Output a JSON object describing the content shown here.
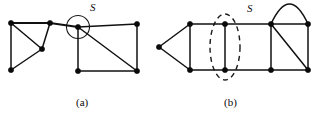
{
  "figure": {
    "panels": [
      {
        "id": "panel-a",
        "caption": "(a)",
        "caption_x": 76,
        "caption_y": 106,
        "cut_label": "S",
        "cut_label_x": 90,
        "cut_label_y": 11,
        "cut_type": "vertex-cut-circle",
        "cut_circle": {
          "cx": 78,
          "cy": 27,
          "r": 11.5
        },
        "vertices": [
          {
            "name": "a-v1",
            "x": 11,
            "y": 23
          },
          {
            "name": "a-v2",
            "x": 11,
            "y": 70
          },
          {
            "name": "a-v3",
            "x": 42,
            "y": 49
          },
          {
            "name": "a-v4",
            "x": 50,
            "y": 23
          },
          {
            "name": "a-v5",
            "x": 78,
            "y": 27
          },
          {
            "name": "a-v6",
            "x": 78,
            "y": 71
          },
          {
            "name": "a-v7",
            "x": 137,
            "y": 24
          },
          {
            "name": "a-v8",
            "x": 137,
            "y": 71
          }
        ],
        "edges": [
          {
            "name": "a-e1",
            "from": 0,
            "to": 1,
            "style": "thin"
          },
          {
            "name": "a-e2",
            "from": 0,
            "to": 2,
            "style": "thin"
          },
          {
            "name": "a-e3",
            "from": 1,
            "to": 2,
            "style": "thin"
          },
          {
            "name": "a-e4",
            "from": 2,
            "to": 3,
            "style": "thin"
          },
          {
            "name": "a-e5",
            "from": 0,
            "to": 3,
            "style": "thick"
          },
          {
            "name": "a-e6",
            "from": 3,
            "to": 4,
            "style": "thick"
          },
          {
            "name": "a-e7",
            "from": 4,
            "to": 6,
            "style": "thin"
          },
          {
            "name": "a-e8",
            "from": 4,
            "to": 5,
            "style": "thin"
          },
          {
            "name": "a-e9",
            "from": 4,
            "to": 7,
            "style": "thin"
          },
          {
            "name": "a-e10",
            "from": 5,
            "to": 7,
            "style": "thin"
          },
          {
            "name": "a-e11",
            "from": 6,
            "to": 7,
            "style": "thin"
          }
        ],
        "arcs": []
      },
      {
        "id": "panel-b",
        "caption": "(b)",
        "caption_x": 224,
        "caption_y": 106,
        "cut_label": "S",
        "cut_label_x": 247,
        "cut_label_y": 12,
        "cut_type": "edge-cut-dashed-ellipse",
        "cut_ellipse": {
          "cx": 225,
          "cy": 47,
          "rx": 15,
          "ry": 33
        },
        "vertices": [
          {
            "name": "b-v1",
            "x": 159,
            "y": 47
          },
          {
            "name": "b-v2",
            "x": 190,
            "y": 24
          },
          {
            "name": "b-v3",
            "x": 190,
            "y": 70
          },
          {
            "name": "b-v4",
            "x": 225,
            "y": 24
          },
          {
            "name": "b-v5",
            "x": 225,
            "y": 70
          },
          {
            "name": "b-v6",
            "x": 271,
            "y": 24
          },
          {
            "name": "b-v7",
            "x": 271,
            "y": 70
          },
          {
            "name": "b-v8",
            "x": 308,
            "y": 24
          },
          {
            "name": "b-v9",
            "x": 308,
            "y": 70
          }
        ],
        "edges": [
          {
            "name": "b-e1",
            "from": 0,
            "to": 1,
            "style": "thin"
          },
          {
            "name": "b-e2",
            "from": 0,
            "to": 2,
            "style": "thin"
          },
          {
            "name": "b-e3",
            "from": 1,
            "to": 2,
            "style": "thin"
          },
          {
            "name": "b-e4",
            "from": 1,
            "to": 3,
            "style": "thin"
          },
          {
            "name": "b-e5",
            "from": 2,
            "to": 4,
            "style": "thin"
          },
          {
            "name": "b-e6",
            "from": 3,
            "to": 4,
            "style": "thin"
          },
          {
            "name": "b-e7",
            "from": 3,
            "to": 5,
            "style": "thin"
          },
          {
            "name": "b-e8",
            "from": 4,
            "to": 6,
            "style": "thin"
          },
          {
            "name": "b-e9",
            "from": 5,
            "to": 6,
            "style": "thin"
          },
          {
            "name": "b-e10",
            "from": 5,
            "to": 7,
            "style": "thin"
          },
          {
            "name": "b-e11",
            "from": 6,
            "to": 8,
            "style": "thin"
          },
          {
            "name": "b-e12",
            "from": 7,
            "to": 8,
            "style": "thin"
          },
          {
            "name": "b-e13",
            "from": 5,
            "to": 8,
            "style": "thin"
          }
        ],
        "arcs": [
          {
            "name": "b-arc-top",
            "from": 5,
            "to": 7,
            "bow": 20
          }
        ]
      }
    ],
    "style": {
      "stroke_color": "#111111",
      "vertex_color": "#0a0a0a",
      "background": "#ffffff",
      "vertex_radius": 2.6
    }
  }
}
